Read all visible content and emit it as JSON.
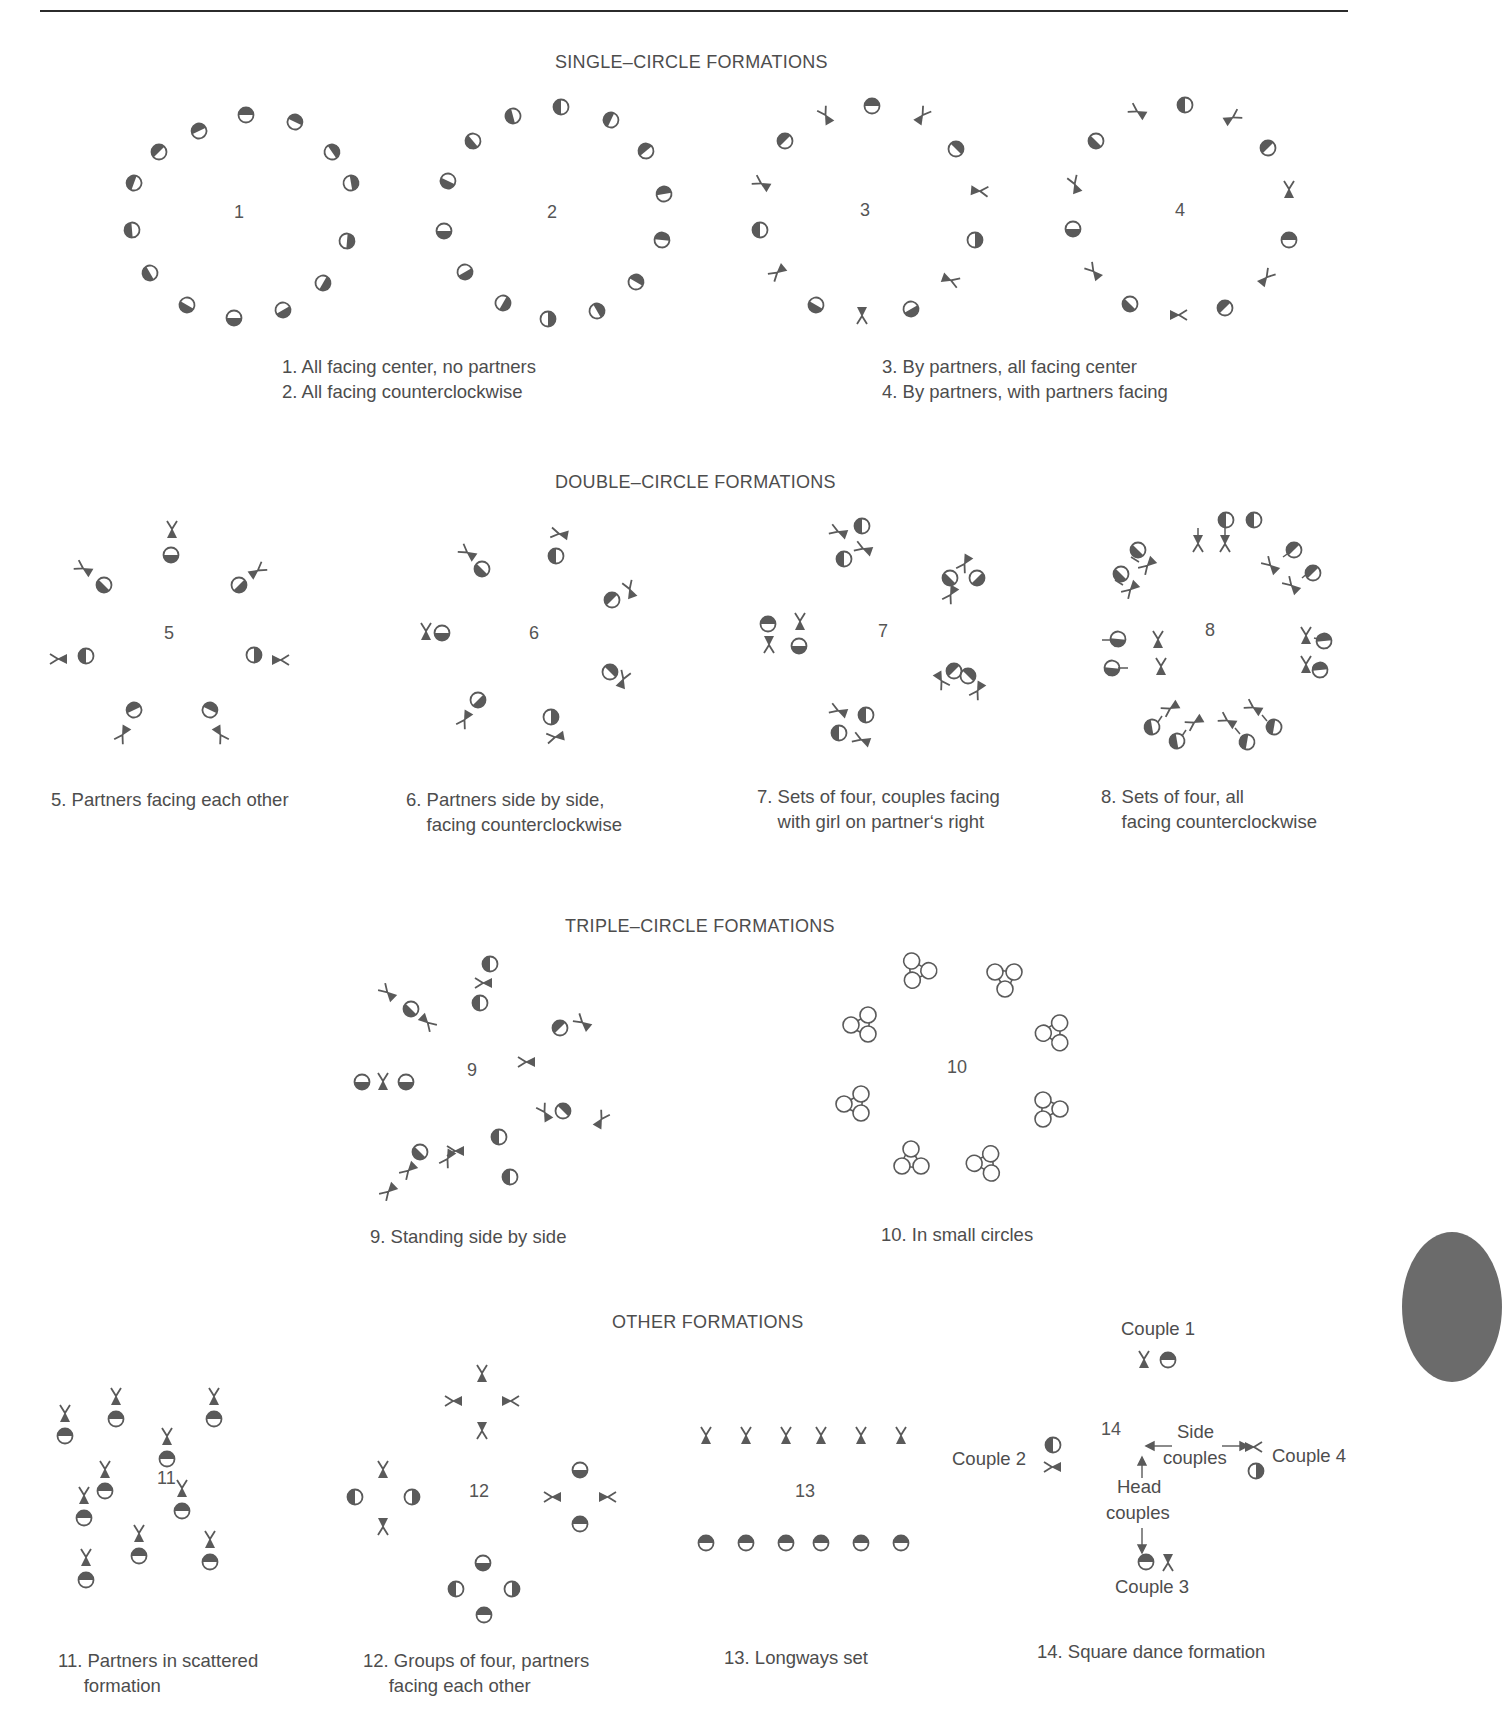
{
  "colors": {
    "ink": "#5a5a5a",
    "text": "#4d4d4d",
    "rule": "#2b2b2b",
    "tab": "#6b6b6b"
  },
  "legend": {
    "girl_symbol": "half-filled-circle-icon",
    "boy_symbol": "hourglass-x-icon"
  },
  "sections": [
    {
      "title": "SINGLE–CIRCLE FORMATIONS",
      "x": 555,
      "y": 52
    },
    {
      "title": "DOUBLE–CIRCLE FORMATIONS",
      "x": 555,
      "y": 472
    },
    {
      "title": "TRIPLE–CIRCLE FORMATIONS",
      "x": 565,
      "y": 916
    },
    {
      "title": "OTHER FORMATIONS",
      "x": 612,
      "y": 1312
    }
  ],
  "figures": [
    {
      "num": "1",
      "nx": 234,
      "ny": 202
    },
    {
      "num": "2",
      "nx": 547,
      "ny": 202
    },
    {
      "num": "3",
      "nx": 860,
      "ny": 200
    },
    {
      "num": "4",
      "nx": 1175,
      "ny": 200
    },
    {
      "num": "5",
      "nx": 164,
      "ny": 623
    },
    {
      "num": "6",
      "nx": 529,
      "ny": 623
    },
    {
      "num": "7",
      "nx": 878,
      "ny": 621
    },
    {
      "num": "8",
      "nx": 1205,
      "ny": 620
    },
    {
      "num": "9",
      "nx": 467,
      "ny": 1060
    },
    {
      "num": "10",
      "nx": 947,
      "ny": 1057
    },
    {
      "num": "11",
      "nx": 157,
      "ny": 1468
    },
    {
      "num": "12",
      "nx": 469,
      "ny": 1481
    },
    {
      "num": "13",
      "nx": 795,
      "ny": 1481
    },
    {
      "num": "14",
      "nx": 1101,
      "ny": 1419
    }
  ],
  "captions": [
    {
      "text": "1. All facing center, no partners\n2. All facing counterclockwise",
      "x": 282,
      "y": 354
    },
    {
      "text": "3. By partners, all facing center\n4. By partners, with partners facing",
      "x": 882,
      "y": 354
    },
    {
      "text": "5. Partners facing each other",
      "x": 51,
      "y": 787
    },
    {
      "text": "6. Partners side by side,\n    facing counterclockwise",
      "x": 406,
      "y": 787
    },
    {
      "text": "7. Sets of four, couples facing\n    with girl on partner‘s right",
      "x": 757,
      "y": 784
    },
    {
      "text": "8. Sets of four, all\n    facing counterclockwise",
      "x": 1101,
      "y": 784
    },
    {
      "text": "9. Standing side by side",
      "x": 370,
      "y": 1224
    },
    {
      "text": "10. In small circles",
      "x": 881,
      "y": 1222
    },
    {
      "text": "11. Partners in scattered\n     formation",
      "x": 58,
      "y": 1648
    },
    {
      "text": "12. Groups of four, partners\n     facing each other",
      "x": 363,
      "y": 1648
    },
    {
      "text": "13. Longways set",
      "x": 724,
      "y": 1645
    },
    {
      "text": "14. Square dance formation",
      "x": 1037,
      "y": 1639
    }
  ],
  "square_dance_labels": {
    "couple1": "Couple 1",
    "couple2": "Couple 2",
    "couple3": "Couple 3",
    "couple4": "Couple 4",
    "side": "Side",
    "side2": "couples",
    "head": "Head",
    "head2": "couples"
  },
  "girls": [
    [
      246,
      115,
      0
    ],
    [
      199,
      131,
      -25
    ],
    [
      159,
      152,
      -45
    ],
    [
      134,
      183,
      -70
    ],
    [
      132,
      230,
      -95
    ],
    [
      150,
      273,
      -120
    ],
    [
      187,
      305,
      -150
    ],
    [
      234,
      318,
      180
    ],
    [
      283,
      310,
      150
    ],
    [
      323,
      283,
      120
    ],
    [
      347,
      241,
      95
    ],
    [
      351,
      183,
      80
    ],
    [
      332,
      152,
      55
    ],
    [
      295,
      122,
      25
    ],
    [
      561,
      107,
      -90
    ],
    [
      513,
      116,
      -105
    ],
    [
      473,
      141,
      -130
    ],
    [
      448,
      181,
      -155
    ],
    [
      444,
      231,
      180
    ],
    [
      465,
      272,
      150
    ],
    [
      503,
      303,
      120
    ],
    [
      548,
      319,
      90
    ],
    [
      597,
      311,
      60
    ],
    [
      636,
      282,
      30
    ],
    [
      662,
      240,
      5
    ],
    [
      664,
      194,
      -10
    ],
    [
      646,
      151,
      -40
    ],
    [
      611,
      120,
      -65
    ],
    [
      872,
      106,
      0
    ],
    [
      785,
      141,
      -45
    ],
    [
      956,
      149,
      45
    ],
    [
      760,
      230,
      -90
    ],
    [
      975,
      240,
      90
    ],
    [
      816,
      305,
      -150
    ],
    [
      911,
      309,
      150
    ],
    [
      1185,
      105,
      -90
    ],
    [
      1096,
      141,
      -135
    ],
    [
      1268,
      148,
      -45
    ],
    [
      1073,
      229,
      180
    ],
    [
      1289,
      240,
      0
    ],
    [
      1130,
      304,
      -135
    ],
    [
      1225,
      308,
      -45
    ],
    [
      171,
      555,
      180
    ],
    [
      104,
      585,
      -135
    ],
    [
      239,
      585,
      135
    ],
    [
      86,
      656,
      -90
    ],
    [
      254,
      655,
      90
    ],
    [
      134,
      710,
      -25
    ],
    [
      210,
      710,
      25
    ],
    [
      482,
      569,
      -135
    ],
    [
      556,
      556,
      -90
    ],
    [
      612,
      600,
      -45
    ],
    [
      442,
      633,
      180
    ],
    [
      610,
      672,
      45
    ],
    [
      478,
      700,
      135
    ],
    [
      551,
      717,
      90
    ],
    [
      862,
      526,
      -90
    ],
    [
      844,
      559,
      -90
    ],
    [
      950,
      578,
      -135
    ],
    [
      977,
      578,
      135
    ],
    [
      768,
      624,
      0
    ],
    [
      799,
      646,
      180
    ],
    [
      954,
      671,
      -45
    ],
    [
      968,
      676,
      45
    ],
    [
      866,
      715,
      -90
    ],
    [
      839,
      733,
      -90
    ],
    [
      1226,
      520,
      -90
    ],
    [
      1254,
      520,
      -90
    ],
    [
      1138,
      550,
      -135
    ],
    [
      1121,
      574,
      -135
    ],
    [
      1294,
      550,
      -45
    ],
    [
      1313,
      573,
      -45
    ],
    [
      1118,
      639,
      -175
    ],
    [
      1112,
      668,
      -175
    ],
    [
      1324,
      641,
      -5
    ],
    [
      1320,
      670,
      -5
    ],
    [
      1152,
      727,
      -100
    ],
    [
      1177,
      741,
      -100
    ],
    [
      1247,
      742,
      -80
    ],
    [
      1274,
      727,
      -80
    ],
    [
      490,
      964,
      -90
    ],
    [
      480,
      1003,
      -90
    ],
    [
      411,
      1009,
      -135
    ],
    [
      560,
      1028,
      -45
    ],
    [
      362,
      1082,
      180
    ],
    [
      406,
      1082,
      180
    ],
    [
      563,
      1111,
      45
    ],
    [
      420,
      1152,
      -135
    ],
    [
      499,
      1137,
      -90
    ],
    [
      510,
      1177,
      -90
    ],
    [
      65,
      1436,
      0
    ],
    [
      116,
      1419,
      0
    ],
    [
      214,
      1419,
      0
    ],
    [
      167,
      1459,
      0
    ],
    [
      105,
      1491,
      0
    ],
    [
      84,
      1518,
      0
    ],
    [
      182,
      1511,
      0
    ],
    [
      139,
      1556,
      0
    ],
    [
      210,
      1562,
      0
    ],
    [
      86,
      1580,
      0
    ],
    [
      355,
      1497,
      -90
    ],
    [
      412,
      1497,
      90
    ],
    [
      580,
      1470,
      180
    ],
    [
      580,
      1524,
      0
    ],
    [
      483,
      1563,
      180
    ],
    [
      456,
      1589,
      -90
    ],
    [
      512,
      1589,
      90
    ],
    [
      484,
      1615,
      0
    ],
    [
      706,
      1543,
      0
    ],
    [
      746,
      1543,
      0
    ],
    [
      786,
      1543,
      0
    ],
    [
      821,
      1543,
      0
    ],
    [
      861,
      1543,
      0
    ],
    [
      901,
      1543,
      0
    ],
    [
      1168,
      1360,
      0
    ],
    [
      1053,
      1445,
      -90
    ],
    [
      1256,
      1471,
      90
    ],
    [
      1146,
      1562,
      0
    ]
  ],
  "boys": [
    [
      826,
      116,
      -30
    ],
    [
      922,
      116,
      35
    ],
    [
      762,
      184,
      -60
    ],
    [
      979,
      191,
      95
    ],
    [
      778,
      272,
      -130
    ],
    [
      950,
      280,
      110
    ],
    [
      862,
      315,
      180
    ],
    [
      1138,
      112,
      -60
    ],
    [
      1232,
      118,
      60
    ],
    [
      1075,
      185,
      -20
    ],
    [
      1289,
      190,
      0
    ],
    [
      1094,
      272,
      -40
    ],
    [
      1266,
      278,
      40
    ],
    [
      1178,
      315,
      90
    ],
    [
      172,
      530,
      0
    ],
    [
      84,
      569,
      -60
    ],
    [
      257,
      571,
      55
    ],
    [
      59,
      659,
      -90
    ],
    [
      280,
      660,
      90
    ],
    [
      123,
      734,
      -150
    ],
    [
      220,
      734,
      150
    ],
    [
      468,
      553,
      -55
    ],
    [
      560,
      534,
      -80
    ],
    [
      630,
      590,
      -20
    ],
    [
      426,
      632,
      0
    ],
    [
      623,
      680,
      20
    ],
    [
      465,
      719,
      -150
    ],
    [
      556,
      737,
      -100
    ],
    [
      839,
      532,
      -70
    ],
    [
      864,
      549,
      -70
    ],
    [
      965,
      563,
      -150
    ],
    [
      951,
      594,
      -150
    ],
    [
      800,
      622,
      0
    ],
    [
      769,
      644,
      180
    ],
    [
      941,
      680,
      150
    ],
    [
      978,
      690,
      -150
    ],
    [
      839,
      711,
      -70
    ],
    [
      862,
      740,
      -70
    ],
    [
      1198,
      543,
      180
    ],
    [
      1225,
      543,
      180
    ],
    [
      1148,
      565,
      -135
    ],
    [
      1131,
      589,
      -135
    ],
    [
      1271,
      566,
      -45
    ],
    [
      1292,
      586,
      -45
    ],
    [
      1158,
      640,
      0
    ],
    [
      1161,
      667,
      0
    ],
    [
      1306,
      636,
      0
    ],
    [
      1306,
      665,
      0
    ],
    [
      1171,
      708,
      -120
    ],
    [
      1195,
      722,
      -120
    ],
    [
      1228,
      721,
      -60
    ],
    [
      1254,
      708,
      -60
    ],
    [
      388,
      993,
      -45
    ],
    [
      484,
      983,
      -90
    ],
    [
      427,
      1022,
      135
    ],
    [
      583,
      1023,
      -50
    ],
    [
      527,
      1062,
      -90
    ],
    [
      383,
      1082,
      0
    ],
    [
      545,
      1113,
      -30
    ],
    [
      601,
      1120,
      30
    ],
    [
      409,
      1170,
      -135
    ],
    [
      448,
      1158,
      -150
    ],
    [
      389,
      1191,
      -135
    ],
    [
      456,
      1151,
      -90
    ],
    [
      65,
      1414,
      0
    ],
    [
      116,
      1397,
      0
    ],
    [
      214,
      1397,
      0
    ],
    [
      167,
      1437,
      0
    ],
    [
      105,
      1470,
      0
    ],
    [
      84,
      1496,
      0
    ],
    [
      182,
      1489,
      0
    ],
    [
      139,
      1534,
      0
    ],
    [
      210,
      1540,
      0
    ],
    [
      86,
      1558,
      0
    ],
    [
      482,
      1374,
      0
    ],
    [
      454,
      1401,
      -90
    ],
    [
      510,
      1401,
      90
    ],
    [
      482,
      1430,
      180
    ],
    [
      383,
      1470,
      0
    ],
    [
      383,
      1526,
      180
    ],
    [
      553,
      1497,
      -90
    ],
    [
      607,
      1497,
      90
    ],
    [
      706,
      1436,
      0
    ],
    [
      746,
      1436,
      0
    ],
    [
      786,
      1436,
      0
    ],
    [
      821,
      1436,
      0
    ],
    [
      861,
      1436,
      0
    ],
    [
      901,
      1436,
      0
    ],
    [
      1144,
      1360,
      0
    ],
    [
      1053,
      1467,
      -90
    ],
    [
      1253,
      1447,
      90
    ],
    [
      1168,
      1562,
      180
    ]
  ],
  "small_circles": [
    [
      918,
      970,
      -30
    ],
    [
      1004,
      978,
      180
    ],
    [
      862,
      1024,
      -90
    ],
    [
      1055,
      1033,
      30
    ],
    [
      855,
      1103,
      -90
    ],
    [
      1049,
      1110,
      90
    ],
    [
      912,
      1160,
      0
    ],
    [
      985,
      1164,
      150
    ]
  ]
}
